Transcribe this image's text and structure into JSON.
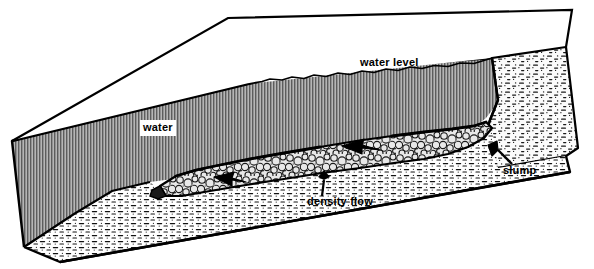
{
  "figure": {
    "background_color": "#ffffff",
    "ink_color": "#000000"
  },
  "labels": {
    "water": "water",
    "water_level": "water level",
    "density_flow": "density flow",
    "slump": "slump"
  },
  "legend_patterns": {
    "water_body": "fine vertical hatch (gray)",
    "density_flow_deposit": "coarse cobble / pebble stipple",
    "slump_mass": "dash-dot sand stipple",
    "basin_floor": "thin dashed silt band"
  },
  "colors": {
    "water_fill": "#a9a9a9",
    "cobble_fill": "#d9d9d9",
    "slump_fill": "#f2f2f2",
    "floor_fill": "#fafafa",
    "outline": "#000000"
  },
  "flow_arrows": [
    {
      "name": "flow-arrow-left",
      "direction": "left"
    },
    {
      "name": "flow-arrow-right",
      "direction": "left"
    }
  ],
  "leaders": [
    {
      "name": "density-flow-leader",
      "from": "density flow",
      "points_to": "cobble deposit"
    },
    {
      "name": "slump-leader",
      "from": "slump",
      "points_to": "slump toe"
    }
  ]
}
